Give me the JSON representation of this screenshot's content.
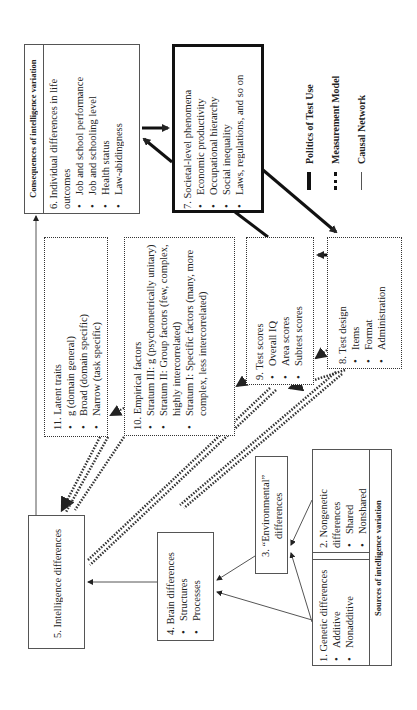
{
  "legend": {
    "items": [
      {
        "label": "Politics of Test Use",
        "style": "thick-solid"
      },
      {
        "label": "Measurement Model",
        "style": "dotted"
      },
      {
        "label": "Causal Network",
        "style": "thin-solid"
      }
    ]
  },
  "consequences": {
    "header": "Consequences of intelligence variation",
    "box6": {
      "title": "6. Individual differences in life outcomes",
      "items": [
        "Job and school performance",
        "Job and schooling level",
        "Health status",
        "Law-abidingness"
      ]
    }
  },
  "box7": {
    "title": "7. Societal-level phenomena",
    "items": [
      "Economic productivity",
      "Occupational hierarchy",
      "Social inequality",
      "Laws, regulations, and so on"
    ]
  },
  "box11": {
    "title": "11. Latent traits",
    "items": [
      "g (domain general)",
      "Broad (domain specific)",
      "Narrow (task specific)"
    ]
  },
  "box10": {
    "title": "10. Empirical factors",
    "items": [
      "Stratum III: g (psychometrically unitary)",
      "Stratum II: Group factors (few, complex, highly intercorrelated)",
      "Stratum I: Specific factors (many, more complex, less intercorrelated)"
    ]
  },
  "box9": {
    "title": "9. Test scores",
    "items": [
      "Overall IQ",
      "Area scores",
      "Subtest scores"
    ]
  },
  "box8": {
    "title": "8. Test design",
    "items": [
      "Items",
      "Format",
      "Administration"
    ]
  },
  "box5": {
    "title": "5. Intelligence differences"
  },
  "box4": {
    "title": "4. Brain differences",
    "items": [
      "Structures",
      "Processes"
    ]
  },
  "box3": {
    "title": "3. “Environmental” differences"
  },
  "sources": {
    "header": "Sources of intelligence variation",
    "box2": {
      "title": "2. Nongenetic differences",
      "items": [
        "Shared",
        "Nonshared"
      ]
    },
    "box1": {
      "title": "1. Genetic differences",
      "items": [
        "Additive",
        "Nonadditive"
      ]
    }
  },
  "colors": {
    "line": "#222222",
    "box_border": "#555555",
    "background": "#ffffff"
  }
}
